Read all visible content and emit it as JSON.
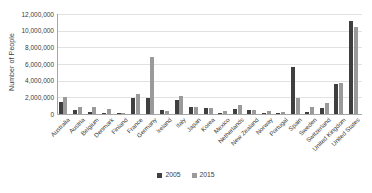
{
  "chart_data": {
    "type": "bar",
    "title": "",
    "xlabel": "",
    "ylabel": "Number of People",
    "ylim": [
      0,
      12000000
    ],
    "ytick_labels": [
      "12,000,000",
      "10,000,000",
      "8,000,000",
      "6,000,000",
      "4,000,000",
      "2,000,000",
      "0"
    ],
    "ytick_values": [
      12000000,
      10000000,
      8000000,
      6000000,
      4000000,
      2000000,
      0
    ],
    "grid": true,
    "legend_position": "bottom-center",
    "categories": [
      "Australia",
      "Austria",
      "Belgium",
      "Denmark",
      "Finland",
      "France",
      "Germany",
      "Ireland",
      "Italy",
      "Japan",
      "Korea",
      "Mexico",
      "Netherlands",
      "New Zealand",
      "Norway",
      "Portugal",
      "Spain",
      "Sweden",
      "Switzerland",
      "United Kingdom",
      "United States"
    ],
    "series": [
      {
        "name": "2005",
        "color": "#3f3f3f",
        "values": [
          1500000,
          500000,
          300000,
          100000,
          50000,
          1900000,
          1900000,
          500000,
          1700000,
          900000,
          700000,
          50000,
          600000,
          500000,
          150000,
          50000,
          5700000,
          300000,
          700000,
          3600000,
          11200000
        ]
      },
      {
        "name": "2015",
        "color": "#9a9a9a",
        "values": [
          2100000,
          900000,
          900000,
          600000,
          150000,
          2450000,
          6900000,
          350000,
          2200000,
          800000,
          700000,
          350000,
          1100000,
          500000,
          350000,
          200000,
          1900000,
          800000,
          1300000,
          3700000,
          10500000
        ]
      }
    ]
  },
  "legend": {
    "items": [
      {
        "label": "2005",
        "color": "#3f3f3f"
      },
      {
        "label": "2015",
        "color": "#9a9a9a"
      }
    ]
  }
}
